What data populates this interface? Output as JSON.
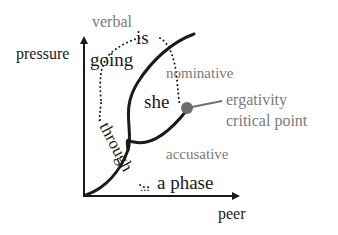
{
  "axes": {
    "y_label": "pressure",
    "x_label": "peer"
  },
  "regions": {
    "verbal": "verbal",
    "nominative": "nominative",
    "accusative": "accusative"
  },
  "phrase_words": {
    "is": "is",
    "going": "going",
    "she": "she",
    "through": "through",
    "a_phase": "a phase"
  },
  "annotation": {
    "line1": "ergativity",
    "line2": "critical point"
  },
  "colors": {
    "ink": "#1a1a1a",
    "grey_text": "#7a7a7a",
    "critical_point": "#6e6e6e"
  }
}
